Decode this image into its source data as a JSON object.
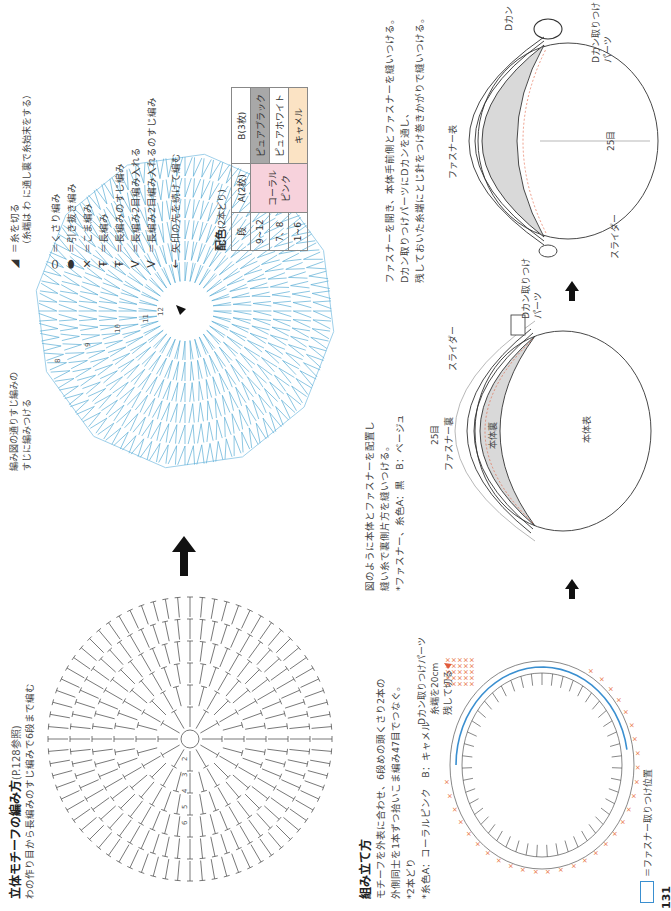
{
  "page_number": "131",
  "motif_section": {
    "title": "立体モチーフの編み方",
    "title_ref": "(P.128参照)",
    "subtitle": "わの作り目から長編みのすじ編みで6段まで編む",
    "gray_chart_round_labels": [
      "2",
      "3",
      "4",
      "5",
      "6"
    ],
    "blue_chart_note_line1": "編み図の通りすじ編みの",
    "blue_chart_note_line2": "すじに編みつける",
    "blue_chart_round_labels": [
      "7",
      "8",
      "9",
      "10",
      "11",
      "12"
    ]
  },
  "legend": {
    "items": [
      {
        "icon": "cut-yarn-icon",
        "label": "＝糸を切る",
        "note": "（糸端は わ に通し裏で糸始末をする）"
      },
      {
        "icon": "chain-stitch-icon",
        "label": "＝くさり編み"
      },
      {
        "icon": "slip-stitch-icon",
        "label": "＝引き抜き編み"
      },
      {
        "icon": "single-crochet-icon",
        "label": "＝こま編み"
      },
      {
        "icon": "double-crochet-icon",
        "label": "＝長編み"
      },
      {
        "icon": "double-crochet-back-loop-icon",
        "label": "＝長編みのすじ編み"
      },
      {
        "icon": "double-crochet-increase-icon",
        "label": "＝長編み2目編み入れる"
      },
      {
        "icon": "double-crochet-increase-back-loop-icon",
        "label": "＝長編み2目編み入れるのすじ編み"
      },
      {
        "icon": "arrow-continue-icon",
        "label": "矢印の先を続けて編む"
      }
    ]
  },
  "color_table": {
    "title": "配色",
    "title_note": "(2本どり)",
    "headers": [
      "段",
      "A(2枚)",
      "B(3枚)"
    ],
    "rows": [
      {
        "rounds": "9~12",
        "A": "コーラル\nピンク",
        "B": "ピュアブラック"
      },
      {
        "rounds": "7、8",
        "A": "",
        "B": "ピュアホワイト"
      },
      {
        "rounds": "1~6",
        "A": "",
        "B": "キャメル"
      }
    ],
    "colors": {
      "pure_black": "#a8a8a8",
      "pure_white": "#ffffff",
      "camel": "#fbe3c4",
      "coral_pink": "#f7d2dc"
    }
  },
  "assembly": {
    "title": "組み立て方",
    "lines": [
      "モチーフを外表に合わせ、6段めの頭くさり2本の",
      "外側同士を1本ずつ拾いこま編み47目でつなぐ。",
      "*2本どり",
      "*糸色A：コーラルピンク　B：キャメル"
    ],
    "d_ring_part_label": "Dカン取りつけパーツ",
    "yarn_end_label_line1": "糸端を20cm",
    "yarn_end_label_line2": "残して切る",
    "zipper_position_label": "＝ファスナー取りつけ位置"
  },
  "zipper_step": {
    "lines": [
      "図のように本体とファスナーを配置し",
      "縫い糸で裏側片方を縫いつける。",
      "*ファスナー、糸色A：黒　B：ベージュ"
    ],
    "label_25": "25目",
    "label_zipper_back": "ファスナー裏",
    "label_body_inside": "本体裏",
    "label_body_outside": "本体表",
    "label_slider": "スライダー",
    "label_d_ring_part": "Dカン取りつけ\nパーツ"
  },
  "final_step": {
    "lines": [
      "ファスナーを開き、本体手前側とファスナーを縫いつける。",
      "Dカン取りつけパーツにDカンを通し、",
      "残しておいた糸端にとじ針をつけ巻きかがりで縫いつける。"
    ],
    "label_zipper_front": "ファスナー表",
    "label_25": "25目",
    "label_slider": "スライダー",
    "label_d_ring": "Dカン",
    "label_d_ring_part": "Dカン取りつけ\nパーツ"
  },
  "colors": {
    "chart_blue": "#5aaed6",
    "chart_gray": "#555555",
    "cross_orange": "#e8703a",
    "zipper_blue": "#3a8fd0",
    "fill_gray": "#d9d9d9",
    "stitch_red": "#e05a3a"
  }
}
